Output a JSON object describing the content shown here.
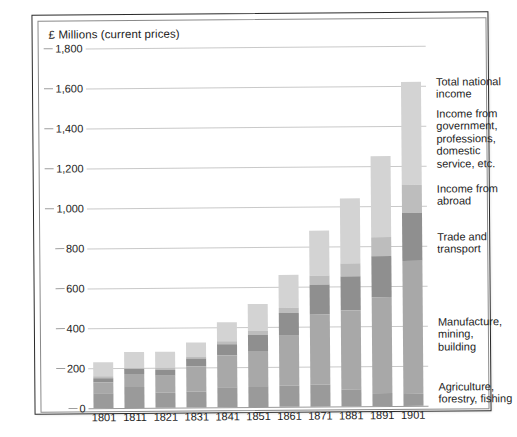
{
  "chart_data": {
    "type": "bar",
    "subtype": "stacked-bar",
    "title": "£ Millions (current prices)",
    "xlabel": "",
    "ylabel": "£ Millions (current prices)",
    "ylim": [
      0,
      1800
    ],
    "ytick_step": 200,
    "ytick_labels": [
      "0",
      "200",
      "400",
      "600",
      "800",
      "1,000",
      "1,200",
      "1,400",
      "1,600",
      "1,800"
    ],
    "ytick_values": [
      0,
      200,
      400,
      600,
      800,
      1000,
      1200,
      1400,
      1600,
      1800
    ],
    "grid": true,
    "legend_position": "right",
    "categories": [
      "1801",
      "1811",
      "1821",
      "1831",
      "1841",
      "1851",
      "1861",
      "1871",
      "1881",
      "1891",
      "1901"
    ],
    "series": [
      {
        "name": "Agriculture, forestry, fishing",
        "color": "#9a9a9a",
        "values": [
          75,
          107,
          75,
          79,
          99,
          101,
          103,
          110,
          83,
          67,
          60
        ]
      },
      {
        "name": "Manufacture, mining, building",
        "color": "#a8a8a8",
        "values": [
          54,
          62,
          85,
          125,
          160,
          180,
          253,
          348,
          395,
          480,
          663
        ]
      },
      {
        "name": "Trade and transport",
        "color": "#8f8f8f",
        "values": [
          22,
          24,
          32,
          40,
          56,
          80,
          112,
          150,
          170,
          205,
          240
        ]
      },
      {
        "name": "Income from abroad",
        "color": "#bdbdbd",
        "values": [
          8,
          8,
          10,
          12,
          14,
          18,
          26,
          48,
          65,
          95,
          140
        ]
      },
      {
        "name": "Income from government, professions, domestic service, etc.",
        "color": "#d3d3d3",
        "values": [
          71,
          79,
          78,
          69,
          96,
          136,
          166,
          224,
          327,
          403,
          517
        ]
      }
    ],
    "totals": [
      230,
      280,
      280,
      325,
      425,
      515,
      660,
      880,
      1040,
      1250,
      1620
    ],
    "total_label": "Total national income",
    "annotations": []
  },
  "legend": {
    "items": [
      {
        "label": "Total national\nincome"
      },
      {
        "label": "Income from\ngovernment,\nprofessions,\ndomestic\nservice, etc."
      },
      {
        "label": "Income from\nabroad"
      },
      {
        "label": "Trade and\ntransport"
      },
      {
        "label": "Manufacture,\nmining,\nbuilding"
      },
      {
        "label": "Agriculture,\nforestry, fishing"
      }
    ]
  },
  "caption": {
    "text": ""
  }
}
